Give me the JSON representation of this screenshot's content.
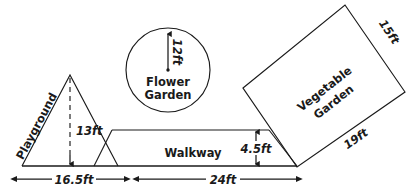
{
  "diagram": {
    "background_color": "#ffffff",
    "line_color": "#1a1a1a",
    "shapes": {
      "playground": {
        "label": "Playground",
        "type": "triangle",
        "height_label": "13ft",
        "base_label": "16.5ft"
      },
      "flower_garden": {
        "label_line1": "Flower",
        "label_line2": "Garden",
        "type": "circle",
        "radius_label": "12ft"
      },
      "walkway": {
        "label": "Walkway",
        "type": "parallelogram",
        "height_label": "4.5ft",
        "base_label": "24ft"
      },
      "vegetable_garden": {
        "label_line1": "Vegetable",
        "label_line2": "Garden",
        "type": "rotated-rectangle",
        "side_label_short": "15ft",
        "side_label_long": "19ft"
      }
    }
  }
}
